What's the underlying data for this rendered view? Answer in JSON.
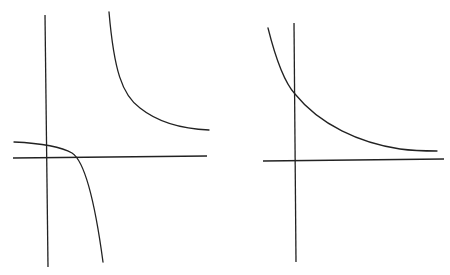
{
  "figures": [
    {
      "id": "left-graph",
      "description": "Rectangular hyperbola with vertical asymptote right of the y-axis and horizontal asymptote above the x-axis; two branches",
      "stroke_color": "#222222",
      "axes": {
        "vertical": {
          "x1": 45,
          "y1": 15,
          "x2": 48,
          "y2": 267
        },
        "horizontal": {
          "x1": 13,
          "y1": 158,
          "x2": 207,
          "y2": 156
        }
      },
      "curves": [
        {
          "name": "upper-branch",
          "path": "M109,12 C114,70 122,95 140,108 C160,124 185,129 209,130"
        },
        {
          "name": "lower-branch",
          "path": "M14,142 C35,143 60,146 72,153 C86,162 96,210 103,262"
        }
      ]
    },
    {
      "id": "right-graph",
      "description": "Exponential decay curve crossing the positive y-axis, approaching a horizontal asymptote above the x-axis",
      "stroke_color": "#222222",
      "axes": {
        "vertical": {
          "x1": 294,
          "y1": 23,
          "x2": 296,
          "y2": 262
        },
        "horizontal": {
          "x1": 263,
          "y1": 161,
          "x2": 444,
          "y2": 159
        }
      },
      "curves": [
        {
          "name": "decay-curve",
          "path": "M268,28 C276,60 284,82 295,94 C320,125 360,143 400,149 C415,151 428,151 437,151"
        }
      ]
    }
  ]
}
